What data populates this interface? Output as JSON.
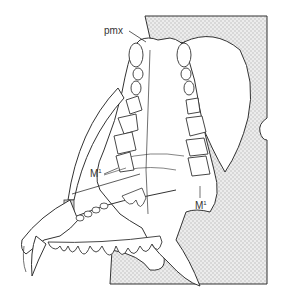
{
  "figure": {
    "labels": {
      "pmx": "pmx",
      "m1_left": "M",
      "m1_left_sup": "1",
      "m1_right": "M",
      "m1_right_sup": "1"
    },
    "colors": {
      "line": "#333333",
      "matrix_fill": "#e6e6e6"
    }
  }
}
